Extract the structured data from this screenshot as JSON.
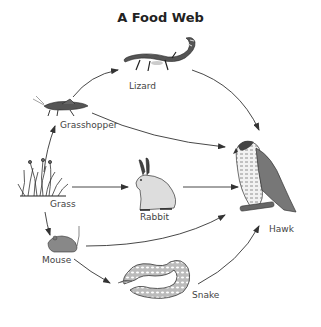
{
  "title": "A Food Web",
  "organisms": {
    "lizard": {
      "label": "Lizard",
      "icon": "lizard-icon"
    },
    "grasshopper": {
      "label": "Grasshopper",
      "icon": "grasshopper-icon"
    },
    "grass": {
      "label": "Grass",
      "icon": "grass-icon"
    },
    "rabbit": {
      "label": "Rabbit",
      "icon": "rabbit-icon"
    },
    "mouse": {
      "label": "Mouse",
      "icon": "mouse-icon"
    },
    "snake": {
      "label": "Snake",
      "icon": "snake-icon"
    },
    "hawk": {
      "label": "Hawk",
      "icon": "hawk-icon"
    }
  },
  "edges": [
    {
      "from": "Grass",
      "to": "Grasshopper"
    },
    {
      "from": "Grass",
      "to": "Rabbit"
    },
    {
      "from": "Grass",
      "to": "Mouse"
    },
    {
      "from": "Grasshopper",
      "to": "Lizard"
    },
    {
      "from": "Grasshopper",
      "to": "Hawk"
    },
    {
      "from": "Lizard",
      "to": "Hawk"
    },
    {
      "from": "Rabbit",
      "to": "Hawk"
    },
    {
      "from": "Mouse",
      "to": "Hawk"
    },
    {
      "from": "Mouse",
      "to": "Snake"
    },
    {
      "from": "Snake",
      "to": "Hawk"
    }
  ]
}
